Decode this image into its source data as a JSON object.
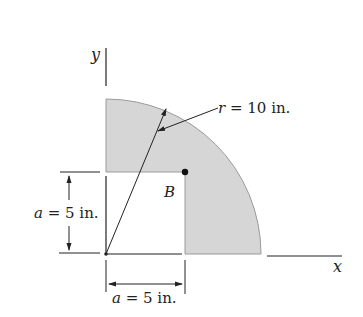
{
  "figure": {
    "axes": {
      "x_label": "x",
      "y_label": "y"
    },
    "radius_label": {
      "var": "r",
      "text": " = 10 in."
    },
    "point_label": "B",
    "dim_vertical": {
      "var": "a",
      "text": " = 5 in."
    },
    "dim_horizontal": {
      "var": "a",
      "text": " = 5 in."
    },
    "colors": {
      "shade": "#d6d6d6",
      "shade_edge": "#9a9a9a",
      "line": "#222222"
    }
  }
}
